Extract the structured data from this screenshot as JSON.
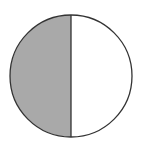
{
  "figure": {
    "fraction_shaded": "1/2",
    "parts_total": 2,
    "parts_shaded": 1
  },
  "colors": {
    "shaded": "#a9a9a9",
    "unshaded": "#ffffff",
    "stroke": "#333333"
  }
}
